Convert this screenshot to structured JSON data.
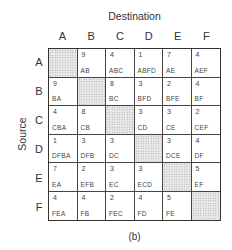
{
  "titles": {
    "destination": "Destination",
    "source": "Source",
    "caption": "(b)"
  },
  "columns": [
    "A",
    "B",
    "C",
    "D",
    "E",
    "F"
  ],
  "rows": [
    "A",
    "B",
    "C",
    "D",
    "E",
    "F"
  ],
  "cells": [
    [
      {
        "num": "",
        "path": "",
        "diag": true
      },
      {
        "num": "9",
        "path": "AB"
      },
      {
        "num": "4",
        "path": "ABC"
      },
      {
        "num": "1",
        "path": "ABFD"
      },
      {
        "num": "7",
        "path": "AE"
      },
      {
        "num": "4",
        "path": "AEF"
      }
    ],
    [
      {
        "num": "9",
        "path": "BA"
      },
      {
        "num": "",
        "path": "",
        "diag": true
      },
      {
        "num": "8",
        "path": "BC"
      },
      {
        "num": "3",
        "path": "BFD"
      },
      {
        "num": "2",
        "path": "BFE"
      },
      {
        "num": "4",
        "path": "BF"
      }
    ],
    [
      {
        "num": "4",
        "path": "CBA"
      },
      {
        "num": "8",
        "path": "CB"
      },
      {
        "num": "",
        "path": "",
        "diag": true
      },
      {
        "num": "3",
        "path": "CD"
      },
      {
        "num": "3",
        "path": "CE"
      },
      {
        "num": "2",
        "path": "CEF"
      }
    ],
    [
      {
        "num": "1",
        "path": "DFBA"
      },
      {
        "num": "3",
        "path": "DFB"
      },
      {
        "num": "3",
        "path": "DC"
      },
      {
        "num": "",
        "path": "",
        "diag": true
      },
      {
        "num": "3",
        "path": "DCE"
      },
      {
        "num": "4",
        "path": "DF"
      }
    ],
    [
      {
        "num": "7",
        "path": "EA"
      },
      {
        "num": "2",
        "path": "EFB"
      },
      {
        "num": "3",
        "path": "EC"
      },
      {
        "num": "3",
        "path": "ECD"
      },
      {
        "num": "",
        "path": "",
        "diag": true
      },
      {
        "num": "5",
        "path": "EF"
      }
    ],
    [
      {
        "num": "4",
        "path": "FEA"
      },
      {
        "num": "4",
        "path": "FB"
      },
      {
        "num": "2",
        "path": "FEC"
      },
      {
        "num": "4",
        "path": "FD"
      },
      {
        "num": "5",
        "path": "FE"
      },
      {
        "num": "",
        "path": "",
        "diag": true
      }
    ]
  ]
}
